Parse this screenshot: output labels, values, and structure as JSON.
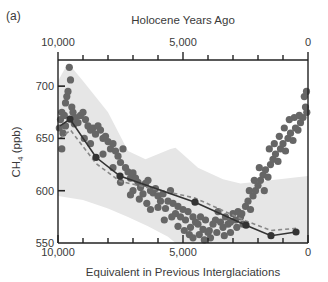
{
  "chart_data": {
    "type": "scatter",
    "panel_label": "(a)",
    "top_axis": {
      "label": "Holocene Years Ago",
      "range": [
        10000,
        0
      ],
      "tick_labels": [
        "10,000",
        "5,000",
        "0"
      ],
      "major_ticks": [
        10000,
        5000,
        0
      ],
      "minor_tick_step": 1000
    },
    "x_axis": {
      "label": "Equivalent in Previous Interglaciations",
      "range": [
        10000,
        0
      ],
      "tick_labels": [
        "10,000",
        "5,000",
        "0"
      ],
      "major_ticks": [
        10000,
        5000,
        0
      ],
      "minor_tick_step": 1000
    },
    "y_axis": {
      "label_main": "CH",
      "label_sub": "4",
      "label_unit": " (ppb)",
      "range": [
        550,
        725
      ],
      "ticks": [
        550,
        600,
        650,
        700
      ],
      "tick_labels": [
        "550",
        "600",
        "650",
        "700"
      ]
    },
    "colors": {
      "band": "#e6e6e6",
      "points": "#666666",
      "mean_line": "#333333",
      "dashed_line": "#888888",
      "axis": "#222222"
    },
    "band": {
      "name": "Range of previous interglaciations",
      "upper": [
        [
          10000,
          705
        ],
        [
          9600,
          722
        ],
        [
          9000,
          705
        ],
        [
          8000,
          675
        ],
        [
          7200,
          638
        ],
        [
          6500,
          630
        ],
        [
          5500,
          640
        ],
        [
          5300,
          641
        ],
        [
          4400,
          622
        ],
        [
          3400,
          611
        ],
        [
          2700,
          607
        ],
        [
          1500,
          610
        ],
        [
          0,
          614
        ]
      ],
      "lower": [
        [
          10000,
          595
        ],
        [
          9000,
          591
        ],
        [
          8000,
          583
        ],
        [
          7200,
          575
        ],
        [
          6400,
          566
        ],
        [
          5600,
          556
        ],
        [
          5300,
          550
        ],
        [
          0,
          550
        ]
      ]
    },
    "series": [
      {
        "name": "Holocene CH4 (scatter)",
        "style": "points",
        "points": [
          [
            9950,
            660
          ],
          [
            9900,
            668
          ],
          [
            9850,
            675
          ],
          [
            9800,
            655
          ],
          [
            9750,
            672
          ],
          [
            9700,
            684
          ],
          [
            9650,
            690
          ],
          [
            9600,
            695
          ],
          [
            9550,
            718
          ],
          [
            9500,
            706
          ],
          [
            9450,
            680
          ],
          [
            9400,
            675
          ],
          [
            9350,
            664
          ],
          [
            9300,
            670
          ],
          [
            9200,
            665
          ],
          [
            9100,
            672
          ],
          [
            9000,
            675
          ],
          [
            8900,
            668
          ],
          [
            8800,
            662
          ],
          [
            8700,
            658
          ],
          [
            8600,
            660
          ],
          [
            8500,
            654
          ],
          [
            8400,
            662
          ],
          [
            8300,
            658
          ],
          [
            8200,
            650
          ],
          [
            8100,
            652
          ],
          [
            8000,
            647
          ],
          [
            7900,
            640
          ],
          [
            7800,
            645
          ],
          [
            7700,
            638
          ],
          [
            7600,
            633
          ],
          [
            7500,
            627
          ],
          [
            7400,
            640
          ],
          [
            7300,
            622
          ],
          [
            7200,
            618
          ],
          [
            7100,
            612
          ],
          [
            7000,
            617
          ],
          [
            7000,
            600
          ],
          [
            6900,
            612
          ],
          [
            6800,
            608
          ],
          [
            6700,
            603
          ],
          [
            6600,
            597
          ],
          [
            6500,
            607
          ],
          [
            6400,
            610
          ],
          [
            6300,
            600
          ],
          [
            6200,
            598
          ],
          [
            6100,
            602
          ],
          [
            6000,
            595
          ],
          [
            5900,
            590
          ],
          [
            5800,
            597
          ],
          [
            5700,
            583
          ],
          [
            5600,
            590
          ],
          [
            5500,
            600
          ],
          [
            5400,
            588
          ],
          [
            5300,
            578
          ],
          [
            5200,
            585
          ],
          [
            5100,
            575
          ],
          [
            5000,
            582
          ],
          [
            4900,
            572
          ],
          [
            4800,
            580
          ],
          [
            4700,
            565
          ],
          [
            4600,
            575
          ],
          [
            4500,
            570
          ],
          [
            4400,
            568
          ],
          [
            4300,
            575
          ],
          [
            4200,
            563
          ],
          [
            4100,
            572
          ],
          [
            4000,
            560
          ],
          [
            3900,
            555
          ],
          [
            3800,
            568
          ],
          [
            3700,
            572
          ],
          [
            3600,
            580
          ],
          [
            3500,
            570
          ],
          [
            3400,
            565
          ],
          [
            3300,
            575
          ],
          [
            3200,
            568
          ],
          [
            3100,
            560
          ],
          [
            3000,
            578
          ],
          [
            2900,
            572
          ],
          [
            2800,
            580
          ],
          [
            2700,
            575
          ],
          [
            2600,
            568
          ],
          [
            2500,
            585
          ],
          [
            2400,
            590
          ],
          [
            2300,
            582
          ],
          [
            2200,
            595
          ],
          [
            2100,
            600
          ],
          [
            2000,
            605
          ],
          [
            1900,
            610
          ],
          [
            1800,
            615
          ],
          [
            1700,
            620
          ],
          [
            1600,
            613
          ],
          [
            1500,
            625
          ],
          [
            1400,
            630
          ],
          [
            1300,
            635
          ],
          [
            1200,
            628
          ],
          [
            1100,
            640
          ],
          [
            1000,
            645
          ],
          [
            900,
            638
          ],
          [
            800,
            650
          ],
          [
            700,
            655
          ],
          [
            600,
            648
          ],
          [
            500,
            660
          ],
          [
            400,
            658
          ],
          [
            300,
            665
          ],
          [
            200,
            670
          ],
          [
            100,
            680
          ],
          [
            50,
            675
          ],
          [
            9850,
            640
          ],
          [
            9700,
            662
          ],
          [
            8950,
            650
          ],
          [
            8700,
            645
          ],
          [
            8200,
            635
          ],
          [
            7800,
            622
          ],
          [
            7500,
            608
          ],
          [
            7100,
            596
          ],
          [
            6750,
            592
          ],
          [
            6450,
            588
          ],
          [
            6300,
            582
          ],
          [
            6000,
            584
          ],
          [
            5750,
            572
          ],
          [
            5450,
            575
          ],
          [
            5200,
            566
          ],
          [
            4950,
            562
          ],
          [
            4750,
            558
          ],
          [
            4600,
            555
          ],
          [
            4350,
            558
          ],
          [
            4150,
            553
          ],
          [
            3950,
            562
          ],
          [
            3650,
            560
          ],
          [
            3350,
            557
          ],
          [
            3100,
            570
          ],
          [
            2850,
            565
          ],
          [
            2650,
            578
          ],
          [
            2350,
            600
          ],
          [
            2150,
            610
          ],
          [
            1950,
            622
          ],
          [
            1750,
            600
          ],
          [
            1550,
            640
          ],
          [
            1350,
            645
          ],
          [
            1150,
            652
          ],
          [
            950,
            660
          ],
          [
            750,
            668
          ],
          [
            550,
            670
          ],
          [
            350,
            672
          ],
          [
            150,
            690
          ],
          [
            60,
            695
          ]
        ]
      },
      {
        "name": "Previous interglaciation mean (solid)",
        "style": "solid-markers",
        "points": [
          [
            9920,
            662
          ],
          [
            9520,
            668.5
          ],
          [
            8480,
            632
          ],
          [
            7520,
            614
          ],
          [
            4520,
            589
          ],
          [
            2480,
            567
          ],
          [
            1480,
            557
          ],
          [
            480,
            560.5
          ]
        ]
      },
      {
        "name": "Previous interglaciation alt. (dashed)",
        "style": "dashed",
        "points": [
          [
            9920,
            650
          ],
          [
            9500,
            658
          ],
          [
            8480,
            626
          ],
          [
            7520,
            609
          ],
          [
            4520,
            593
          ],
          [
            2480,
            571
          ],
          [
            1480,
            562
          ],
          [
            480,
            564
          ]
        ]
      }
    ]
  }
}
